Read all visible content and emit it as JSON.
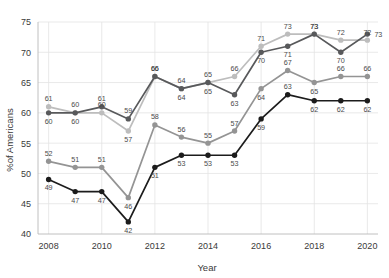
{
  "chart_data": {
    "type": "line",
    "title": "",
    "xlabel": "Year",
    "ylabel": "%of Americans",
    "x": [
      2008,
      2009,
      2010,
      2011,
      2012,
      2013,
      2014,
      2015,
      2016,
      2017,
      2018,
      2019,
      2020
    ],
    "xticks": [
      2008,
      2010,
      2012,
      2014,
      2016,
      2018,
      2020
    ],
    "yticks": [
      40,
      45,
      50,
      55,
      60,
      65,
      70,
      75
    ],
    "xlim": [
      2007.6,
      2020.4
    ],
    "ylim": [
      40,
      75
    ],
    "grid": true,
    "legend": "none",
    "series": [
      {
        "name": "series-light-gray",
        "color": "#bdbdbd",
        "values": [
          61,
          60,
          60,
          57,
          66,
          64,
          65,
          66,
          71,
          73,
          73,
          72,
          72
        ],
        "labels": [
          "61",
          "60",
          "60",
          "57",
          "66",
          "64",
          "65",
          "66",
          "71",
          "73",
          "73",
          "72",
          "72"
        ]
      },
      {
        "name": "series-dark-gray",
        "color": "#58595b",
        "values": [
          60,
          60,
          61,
          59,
          66,
          64,
          65,
          63,
          70,
          71,
          73,
          70,
          73
        ],
        "labels": [
          "60",
          "60",
          "61",
          "59",
          "66",
          "64",
          "65",
          "63",
          "70",
          "71",
          "73",
          "70",
          "73"
        ]
      },
      {
        "name": "series-medium-gray",
        "color": "#949494",
        "values": [
          52,
          51,
          51,
          46,
          58,
          56,
          55,
          57,
          64,
          67,
          65,
          66,
          66
        ],
        "labels": [
          "52",
          "51",
          "51",
          "46",
          "58",
          "56",
          "55",
          "57",
          "64",
          "67",
          "65",
          "66",
          "66"
        ]
      },
      {
        "name": "series-black",
        "color": "#1c1c1c",
        "values": [
          49,
          47,
          47,
          42,
          51,
          53,
          53,
          53,
          59,
          63,
          62,
          62,
          62
        ],
        "labels": [
          "49",
          "47",
          "47",
          "42",
          "51",
          "53",
          "53",
          "53",
          "59",
          "63",
          "62",
          "62",
          "62"
        ]
      }
    ]
  }
}
